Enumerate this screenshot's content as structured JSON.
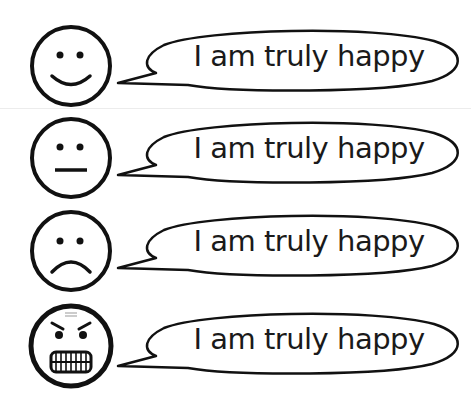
{
  "rows": [
    {
      "emotion": "happy",
      "speech": "I am truly happy"
    },
    {
      "emotion": "neutral",
      "speech": "I am truly happy"
    },
    {
      "emotion": "sad",
      "speech": "I am truly happy"
    },
    {
      "emotion": "angry",
      "speech": "I am truly happy"
    }
  ],
  "colors": {
    "stroke": "#111111",
    "background": "#ffffff"
  }
}
